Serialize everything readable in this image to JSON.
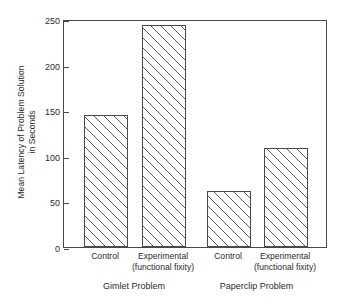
{
  "chart_data": {
    "type": "bar",
    "title": "",
    "subtitle": "",
    "xlabel": "",
    "ylabel_line1": "Mean Latency of Problem Solution",
    "ylabel_line2": "in Seconds",
    "ylim": [
      0,
      250
    ],
    "yticks": [
      0,
      50,
      100,
      150,
      200,
      250
    ],
    "ytick_labels": [
      "0",
      "50",
      "100",
      "150",
      "200",
      "250"
    ],
    "grid": false,
    "legend": "none",
    "bar_fill": "hatched-diagonal",
    "categories": [
      "Control",
      "Experimental (functional fixity)",
      "Control",
      "Experimental (functional fixity)"
    ],
    "category_lines": [
      {
        "line1": "Control",
        "line2": ""
      },
      {
        "line1": "Experimental",
        "line2": "(functional fixity)"
      },
      {
        "line1": "Control",
        "line2": ""
      },
      {
        "line1": "Experimental",
        "line2": "(functional fixity)"
      }
    ],
    "values": [
      145,
      243,
      61,
      109
    ],
    "groups": [
      {
        "label": "Gimlet Problem",
        "categories": [
          "Control",
          "Experimental (functional fixity)"
        ],
        "values": [
          145,
          243
        ]
      },
      {
        "label": "Paperclip Problem",
        "categories": [
          "Control",
          "Experimental (functional fixity)"
        ],
        "values": [
          61,
          109
        ]
      }
    ],
    "colors": {
      "axis": "#4a4a4a",
      "text": "#2b2b2b",
      "bar_edge": "#4a4a4a",
      "bar_hatch": "#5a5a5a",
      "background": "#ffffff"
    }
  }
}
